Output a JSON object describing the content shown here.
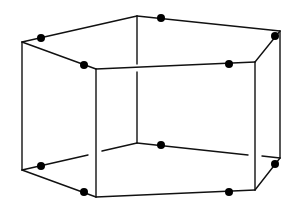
{
  "diagram": {
    "type": "pentagonal-prism-wireframe",
    "line_color": "#111111",
    "dot_color": "#000000",
    "background": "#ffffff",
    "vertices": {
      "top": [
        {
          "id": "A",
          "x": 22,
          "y": 42
        },
        {
          "id": "B",
          "x": 137,
          "y": 16
        },
        {
          "id": "C",
          "x": 280,
          "y": 31
        },
        {
          "id": "D",
          "x": 255,
          "y": 62
        },
        {
          "id": "E",
          "x": 96,
          "y": 69
        }
      ],
      "bottom": [
        {
          "id": "A'",
          "x": 22,
          "y": 170
        },
        {
          "id": "B'",
          "x": 137,
          "y": 143
        },
        {
          "id": "C'",
          "x": 280,
          "y": 158
        },
        {
          "id": "D'",
          "x": 255,
          "y": 190
        },
        {
          "id": "E'",
          "x": 96,
          "y": 197
        }
      ]
    },
    "edges": [
      {
        "id": "top-AB",
        "x1": 22,
        "y1": 42,
        "x2": 137,
        "y2": 16
      },
      {
        "id": "top-BC",
        "x1": 137,
        "y1": 16,
        "x2": 280,
        "y2": 31
      },
      {
        "id": "top-CD",
        "x1": 280,
        "y1": 31,
        "x2": 255,
        "y2": 62
      },
      {
        "id": "top-DE",
        "x1": 255,
        "y1": 62,
        "x2": 96,
        "y2": 69
      },
      {
        "id": "top-EA",
        "x1": 96,
        "y1": 69,
        "x2": 22,
        "y2": 42
      },
      {
        "id": "vert-A",
        "x1": 22,
        "y1": 42,
        "x2": 22,
        "y2": 170
      },
      {
        "id": "vert-C",
        "x1": 280,
        "y1": 31,
        "x2": 280,
        "y2": 158
      },
      {
        "id": "vert-D",
        "x1": 255,
        "y1": 62,
        "x2": 255,
        "y2": 190
      },
      {
        "id": "vert-E",
        "x1": 96,
        "y1": 69,
        "x2": 96,
        "y2": 197
      },
      {
        "id": "vert-B-upper",
        "x1": 137,
        "y1": 16,
        "x2": 137,
        "y2": 64
      },
      {
        "id": "vert-B-lower",
        "x1": 137,
        "y1": 72,
        "x2": 137,
        "y2": 143
      },
      {
        "id": "bot-AB-left",
        "x1": 22,
        "y1": 170,
        "x2": 88,
        "y2": 155
      },
      {
        "id": "bot-AB-right",
        "x1": 102,
        "y1": 151,
        "x2": 137,
        "y2": 143
      },
      {
        "id": "bot-BC-left",
        "x1": 137,
        "y1": 143,
        "x2": 248,
        "y2": 155
      },
      {
        "id": "bot-BC-right",
        "x1": 262,
        "y1": 156,
        "x2": 280,
        "y2": 158
      },
      {
        "id": "bot-CD",
        "x1": 280,
        "y1": 158,
        "x2": 255,
        "y2": 190
      },
      {
        "id": "bot-DE",
        "x1": 255,
        "y1": 190,
        "x2": 96,
        "y2": 197
      },
      {
        "id": "bot-EA",
        "x1": 96,
        "y1": 197,
        "x2": 22,
        "y2": 170
      }
    ],
    "points": [
      {
        "id": "p-top-1",
        "x": 41,
        "y": 38
      },
      {
        "id": "p-top-2",
        "x": 161,
        "y": 18
      },
      {
        "id": "p-top-3",
        "x": 275,
        "y": 36
      },
      {
        "id": "p-top-4",
        "x": 229,
        "y": 64
      },
      {
        "id": "p-top-5",
        "x": 84,
        "y": 65
      },
      {
        "id": "p-bot-1",
        "x": 41,
        "y": 166
      },
      {
        "id": "p-bot-2",
        "x": 161,
        "y": 145
      },
      {
        "id": "p-bot-3",
        "x": 275,
        "y": 164
      },
      {
        "id": "p-bot-4",
        "x": 229,
        "y": 192
      },
      {
        "id": "p-bot-5",
        "x": 84,
        "y": 192
      }
    ],
    "point_radius": 4
  }
}
